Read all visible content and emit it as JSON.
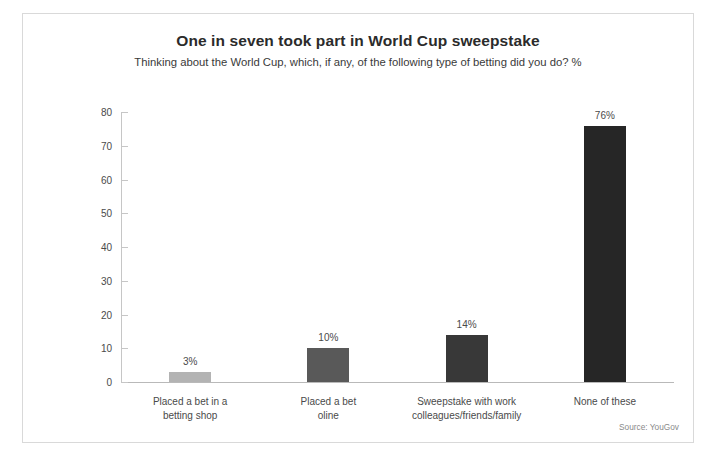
{
  "chart_data": {
    "type": "bar",
    "title": "One in seven took part in World Cup sweepstake",
    "subtitle": "Thinking about the World Cup, which, if any, of the following type of betting did you do? %",
    "categories": [
      "Placed a bet in a betting shop",
      "Placed a bet oline",
      "Sweepstake with work colleagues/friends/family",
      "None of these"
    ],
    "category_lines": [
      [
        "Placed a bet in a",
        "betting shop"
      ],
      [
        "Placed a bet",
        "oline"
      ],
      [
        "Sweepstake with work",
        "colleagues/friends/family"
      ],
      [
        "None of these"
      ]
    ],
    "values": [
      3,
      10,
      14,
      76
    ],
    "value_labels": [
      "3%",
      "10%",
      "14%",
      "76%"
    ],
    "bar_colors": [
      "#b3b3b3",
      "#595959",
      "#383838",
      "#262626"
    ],
    "xlabel": "",
    "ylabel": "",
    "ylim": [
      0,
      80
    ],
    "yticks": [
      0,
      10,
      20,
      30,
      40,
      50,
      60,
      70,
      80
    ],
    "ytick_labels": [
      "0",
      "10",
      "20",
      "30",
      "40",
      "50",
      "60",
      "70",
      "80"
    ],
    "grid": false,
    "legend": null
  },
  "source": "Source: YouGov"
}
